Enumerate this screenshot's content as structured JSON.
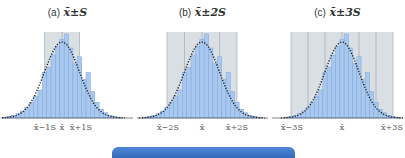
{
  "colors": {
    "shade": "#d9dfe3",
    "bar_fill": "#a9c8ef",
    "bar_stroke": "#7fa6d8",
    "curve": "#222222",
    "grid": "#9aa3aa",
    "footer_bar": "#3a72c4"
  },
  "panels": [
    {
      "label": "(a)",
      "expr": "x̄±S",
      "xlabels": [
        "x̄−1S",
        "x̄",
        "x̄+1S"
      ]
    },
    {
      "label": "(b)",
      "expr": "x̄±2S",
      "xlabels": [
        "x̄−2S",
        "x̄",
        "x̄+2S"
      ]
    },
    {
      "label": "(c)",
      "expr": "x̄±3S",
      "xlabels": [
        "x̄−3S",
        "x̄",
        "x̄+3S"
      ]
    }
  ],
  "chart_data": [
    {
      "type": "bar",
      "title": "(a) x̄±S",
      "description": "Histogram with normal curve overlay; shaded region covers mean ± 1 standard deviation",
      "categories": [
        "-3.25",
        "-3.0",
        "-2.75",
        "-2.5",
        "-2.25",
        "-2.0",
        "-1.75",
        "-1.5",
        "-1.25",
        "-1.0",
        "-0.75",
        "-0.5",
        "-0.25",
        "0",
        "0.25",
        "0.5",
        "0.75",
        "1.0",
        "1.25",
        "1.5",
        "1.75",
        "2.0",
        "2.25",
        "2.5",
        "2.75",
        "3.0",
        "3.25"
      ],
      "values": [
        1,
        2,
        3,
        5,
        8,
        12,
        18,
        25,
        32,
        52,
        58,
        72,
        82,
        90,
        96,
        80,
        62,
        70,
        44,
        52,
        30,
        18,
        10,
        6,
        3,
        2,
        1
      ],
      "shaded_range_sd": [
        -1,
        1
      ],
      "xticks": [
        "x̄−1S",
        "x̄",
        "x̄+1S"
      ],
      "curve": "normal (dotted)"
    },
    {
      "type": "bar",
      "title": "(b) x̄±2S",
      "description": "Same histogram; shaded region covers mean ± 2 standard deviations",
      "categories": [
        "-3.25",
        "-3.0",
        "-2.75",
        "-2.5",
        "-2.25",
        "-2.0",
        "-1.75",
        "-1.5",
        "-1.25",
        "-1.0",
        "-0.75",
        "-0.5",
        "-0.25",
        "0",
        "0.25",
        "0.5",
        "0.75",
        "1.0",
        "1.25",
        "1.5",
        "1.75",
        "2.0",
        "2.25",
        "2.5",
        "2.75",
        "3.0",
        "3.25"
      ],
      "values": [
        1,
        2,
        3,
        5,
        8,
        12,
        18,
        25,
        32,
        52,
        58,
        72,
        82,
        90,
        96,
        80,
        62,
        70,
        44,
        52,
        30,
        18,
        10,
        6,
        3,
        2,
        1
      ],
      "shaded_range_sd": [
        -2,
        2
      ],
      "xticks": [
        "x̄−2S",
        "x̄",
        "x̄+2S"
      ],
      "curve": "normal (dotted)"
    },
    {
      "type": "bar",
      "title": "(c) x̄±3S",
      "description": "Same histogram; shaded region covers mean ± 3 standard deviations",
      "categories": [
        "-3.25",
        "-3.0",
        "-2.75",
        "-2.5",
        "-2.25",
        "-2.0",
        "-1.75",
        "-1.5",
        "-1.25",
        "-1.0",
        "-0.75",
        "-0.5",
        "-0.25",
        "0",
        "0.25",
        "0.5",
        "0.75",
        "1.0",
        "1.25",
        "1.5",
        "1.75",
        "2.0",
        "2.25",
        "2.5",
        "2.75",
        "3.0",
        "3.25"
      ],
      "values": [
        1,
        2,
        3,
        5,
        8,
        12,
        18,
        25,
        32,
        52,
        58,
        72,
        82,
        90,
        96,
        80,
        62,
        70,
        44,
        52,
        30,
        18,
        10,
        6,
        3,
        2,
        1
      ],
      "shaded_range_sd": [
        -3,
        3
      ],
      "xticks": [
        "x̄−3S",
        "x̄",
        "x̄+3S"
      ],
      "curve": "normal (dotted)"
    }
  ]
}
